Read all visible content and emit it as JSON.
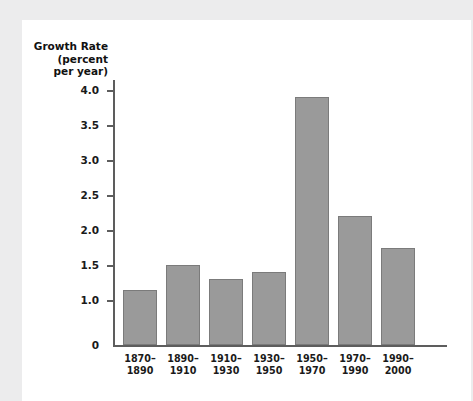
{
  "chart_data": {
    "type": "bar",
    "title": "",
    "ylabel": "Growth Rate\n(percent\nper year)",
    "xlabel": "",
    "categories": [
      "1870–\n1890",
      "1890–\n1910",
      "1910–\n1930",
      "1930–\n1950",
      "1950–\n1970",
      "1970–\n1990",
      "1990–\n2000"
    ],
    "values": [
      1.15,
      1.5,
      1.3,
      1.4,
      3.9,
      2.2,
      1.75
    ],
    "ylim": [
      0,
      4.0
    ],
    "ytick_labels": [
      "4.0",
      "3.5",
      "3.0",
      "2.5",
      "2.0",
      "1.5",
      "1.0",
      "0"
    ],
    "ytick_values": [
      4.0,
      3.5,
      3.0,
      2.5,
      2.0,
      1.5,
      1.0,
      0
    ],
    "grid": false,
    "legend": null,
    "axis_break": true,
    "bar_color": "#9a9a9a",
    "bar_border_color": "#7b7b7b",
    "axis_color": "#5d5d5d",
    "plot_background": "#ffffff",
    "page_background": "#ececed"
  },
  "axis": {
    "y_title": "Growth Rate\n(percent\nper year)",
    "zero_label": "0"
  }
}
